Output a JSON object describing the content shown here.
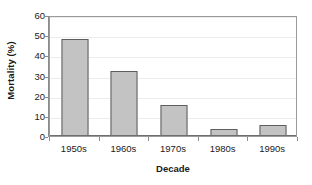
{
  "chart_data": {
    "type": "bar",
    "title": "",
    "subtitle": "",
    "xlabel": "Decade",
    "ylabel": "Mortality (%)",
    "categories": [
      "1950s",
      "1960s",
      "1970s",
      "1980s",
      "1990s"
    ],
    "values": [
      48,
      32,
      15.5,
      3.5,
      5.5
    ],
    "ylim": [
      0,
      60
    ],
    "ytick_values": [
      0,
      10,
      20,
      30,
      40,
      50,
      60
    ],
    "ytick_labels": [
      "0",
      "10",
      "20",
      "30",
      "40",
      "50",
      "60"
    ],
    "grid": true,
    "grid_axis": "y",
    "legend": false,
    "legend_position": "none",
    "annotations": [],
    "series": [
      {
        "name": "Mortality",
        "values": [
          48,
          32,
          15.5,
          3.5,
          5.5
        ]
      }
    ]
  },
  "style": {
    "bar_fill": "#c3c3c3",
    "bar_border": "#5e5e5e",
    "gridline_color": "#ececed",
    "axis_color": "#8c8c8c",
    "plot_border_color": "#9a9a9a",
    "text_color": "#1a1a1a",
    "background": "#ffffff"
  }
}
